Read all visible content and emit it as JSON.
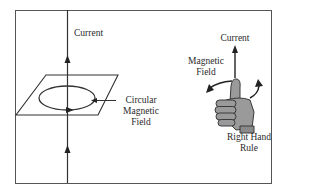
{
  "diagram": {
    "left_panel": {
      "current_label": "Current",
      "field_label_line1": "Circular",
      "field_label_line2": "Magnetic",
      "field_label_line3": "Field"
    },
    "right_panel": {
      "current_label": "Current",
      "field_label_line1": "Magnetic",
      "field_label_line2": "Field",
      "rule_label_line1": "Right Hand",
      "rule_label_line2": "Rule"
    },
    "colors": {
      "line": "#333333",
      "frame": "#555555",
      "hand_fill": "#9a9a9a",
      "hand_outline": "#3a3a3a"
    }
  }
}
